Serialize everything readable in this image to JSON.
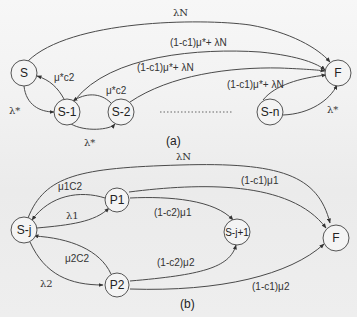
{
  "diagram_a": {
    "caption": "(a)",
    "nodes": {
      "S": "S",
      "S1": "S-1",
      "S2": "S-2",
      "Sn": "S-n",
      "F": "F"
    },
    "edges": {
      "S_to_F": "λN",
      "S1_to_F": "(1-c1)μ*+ λN",
      "S2_to_F": "(1-c1)μ*+ λN",
      "Sn_to_F_upper": "(1-c1)μ*+ λN",
      "Sn_to_F_lower": "λ*",
      "S1_to_S": "μ*c2",
      "S_to_S1": "λ*",
      "S2_to_S1": "μ*c2",
      "S1_to_S2": "λ*"
    },
    "ellipsis": "........"
  },
  "diagram_b": {
    "caption": "(b)",
    "nodes": {
      "Sj": "S-j",
      "P1": "P1",
      "P2": "P2",
      "Sj1": "S-j+1",
      "F": "F"
    },
    "edges": {
      "Sj_to_F": "λN",
      "P1_to_Sj": "μ1C2",
      "Sj_to_P1": "λ1",
      "P1_to_Sj1": "(1-c2)μ1",
      "P1_to_F": "(1-c1)μ1",
      "P2_to_Sj": "μ2C2",
      "Sj_to_P2": "λ2",
      "P2_to_Sj1": "(1-c2)μ2",
      "P2_to_F": "(1-c1)μ2"
    }
  }
}
